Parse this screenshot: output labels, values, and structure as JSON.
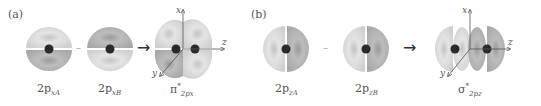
{
  "panels": [
    {
      "label": "(a)",
      "orbital_A": {
        "base": "2p",
        "sub": "xA"
      },
      "operator": "–",
      "orbital_B": {
        "base": "2p",
        "sub": "xB"
      },
      "result": {
        "base": "π",
        "sup": "*",
        "sub": "2px"
      },
      "axes": {
        "x": "x",
        "y": "y",
        "z": "z"
      }
    },
    {
      "label": "(b)",
      "orbital_A": {
        "base": "2p",
        "sub": "zA"
      },
      "operator": "–",
      "orbital_B": {
        "base": "2p",
        "sub": "zB"
      },
      "result": {
        "base": "σ",
        "sup": "*",
        "sub": "2pz"
      },
      "axes": {
        "x": "x",
        "y": "y",
        "z": "z"
      }
    }
  ],
  "arrow_glyph": "→",
  "colors": {
    "lobe_light": "#d8d8d8",
    "lobe_dark": "#a9a9a9",
    "nucleus": "#2a2a2a",
    "axis": "#555555"
  }
}
